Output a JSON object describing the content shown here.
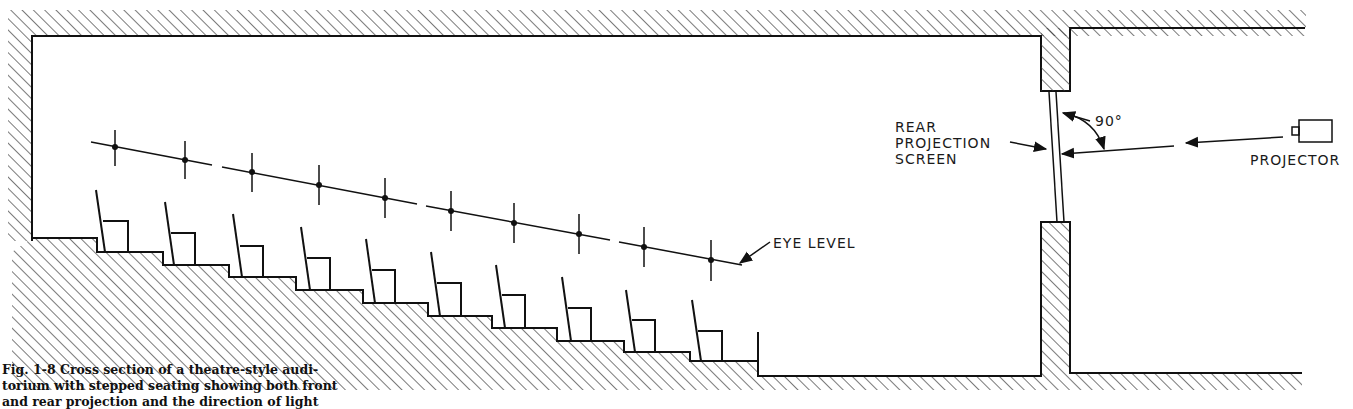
{
  "figure": {
    "caption_line_1": "Fig. 1-8  Cross section of a theatre-style audi-",
    "caption_line_2": "torium with stepped seating showing both front",
    "caption_line_3": "and rear projection and the direction of light"
  },
  "labels": {
    "eye_level": "EYE LEVEL",
    "rear_projection_screen_line_1": "REAR",
    "rear_projection_screen_line_2": "PROJECTION",
    "rear_projection_screen_line_3": "SCREEN",
    "angle": "90°",
    "projector": "PROJECTOR"
  },
  "diagram": {
    "seat_rows": 10,
    "line_color": "#111111",
    "background": "#ffffff"
  }
}
